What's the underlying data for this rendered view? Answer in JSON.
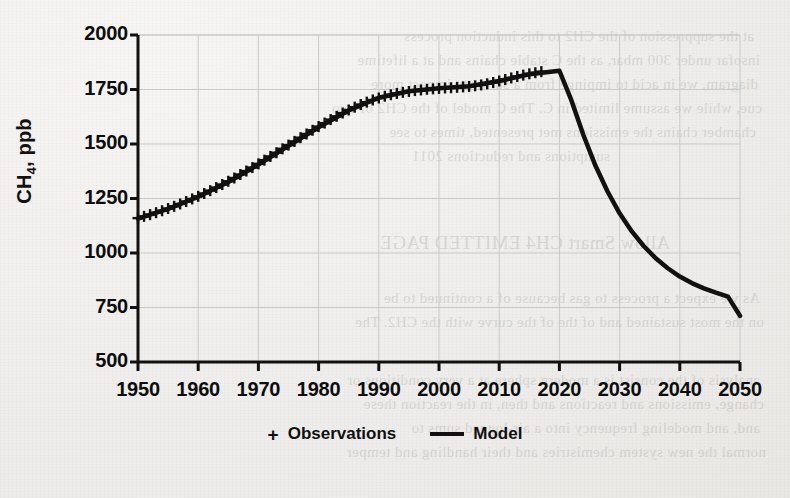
{
  "chart_data": {
    "type": "line",
    "title": "",
    "xlabel": "",
    "ylabel": "CH4, ppb",
    "ylabel_prefix": "CH",
    "ylabel_sub": "4",
    "ylabel_suffix": ", ppb",
    "xlim": [
      1950,
      2050
    ],
    "ylim": [
      500,
      2000
    ],
    "xticks": [
      1950,
      1960,
      1970,
      1980,
      1990,
      2000,
      2010,
      2020,
      2030,
      2040,
      2050
    ],
    "yticks": [
      500,
      750,
      1000,
      1250,
      1500,
      1750,
      2000
    ],
    "grid": true,
    "legend_position": "bottom-center",
    "series": [
      {
        "name": "Observations",
        "marker": "+",
        "color": "#111111",
        "x": [
          1950,
          1951,
          1952,
          1953,
          1954,
          1955,
          1956,
          1957,
          1958,
          1959,
          1960,
          1961,
          1962,
          1963,
          1964,
          1965,
          1966,
          1967,
          1968,
          1969,
          1970,
          1971,
          1972,
          1973,
          1974,
          1975,
          1976,
          1977,
          1978,
          1979,
          1980,
          1981,
          1982,
          1983,
          1984,
          1985,
          1986,
          1987,
          1988,
          1989,
          1990,
          1991,
          1992,
          1993,
          1994,
          1995,
          1996,
          1997,
          1998,
          1999,
          2000,
          2001,
          2002,
          2003,
          2004,
          2005,
          2006,
          2007,
          2008,
          2009,
          2010,
          2011,
          2012,
          2013,
          2014,
          2015,
          2016,
          2017
        ],
        "y": [
          1160,
          1168,
          1176,
          1185,
          1194,
          1204,
          1214,
          1225,
          1236,
          1248,
          1260,
          1273,
          1286,
          1300,
          1314,
          1329,
          1344,
          1360,
          1376,
          1392,
          1409,
          1426,
          1443,
          1460,
          1478,
          1495,
          1512,
          1529,
          1546,
          1563,
          1580,
          1596,
          1612,
          1627,
          1642,
          1656,
          1669,
          1681,
          1692,
          1702,
          1711,
          1719,
          1726,
          1732,
          1737,
          1741,
          1745,
          1748,
          1751,
          1753,
          1755,
          1757,
          1758,
          1760,
          1762,
          1764,
          1767,
          1771,
          1776,
          1782,
          1789,
          1796,
          1803,
          1810,
          1816,
          1822,
          1827,
          1832
        ]
      },
      {
        "name": "Model",
        "marker": "line",
        "color": "#111111",
        "x": [
          1950,
          1955,
          1960,
          1965,
          1970,
          1975,
          1980,
          1985,
          1990,
          1995,
          2000,
          2005,
          2010,
          2015,
          2020,
          2022,
          2024,
          2026,
          2028,
          2030,
          2032,
          2034,
          2036,
          2038,
          2040,
          2042,
          2044,
          2046,
          2048,
          2050
        ],
        "y": [
          1158,
          1202,
          1258,
          1326,
          1406,
          1492,
          1577,
          1654,
          1712,
          1742,
          1756,
          1765,
          1789,
          1820,
          1836,
          1700,
          1540,
          1400,
          1282,
          1182,
          1100,
          1032,
          976,
          930,
          892,
          862,
          838,
          818,
          800,
          712
        ]
      }
    ],
    "annotations": []
  },
  "legend": {
    "items": [
      {
        "marker": "+",
        "label": "Observations"
      },
      {
        "marker": "line",
        "label": "Model"
      }
    ]
  },
  "background_text": [
    "at the suppression of the CH2 to this induction process",
    "insofar under 300 mbar, as the C stable chains and at a lifetime",
    "diagram, we in acid to impinge from a sulfur to impact more",
    "cue, while we assume limited in C. The C model of the CH2 of two",
    "chamber chains the emissions met presented, times to see",
    "sumptions and reductions 2011",
    "Allow Smart CH4 EMITTED PAGE",
    "As we expect a process to gas because of a continued to be",
    "on the most sustained and of the of the curve with the CH2. The",
    "analysis of the consist is a modern sphere at a very conditions or",
    "change, emissions and reactions and then, in the reaction these",
    "and, and modeling frequency into a air-logged sums to",
    "normal the new system chemistries and their handling and temper"
  ]
}
